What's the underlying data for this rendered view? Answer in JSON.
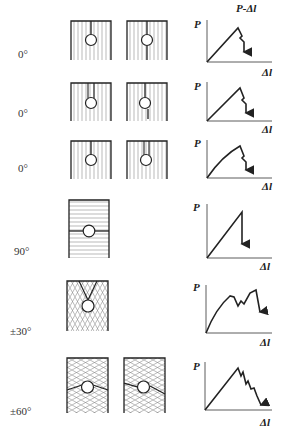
{
  "figure": {
    "title": "P-Δl",
    "y_axis_label": "P",
    "x_axis_label": "Δl"
  },
  "rows": [
    {
      "angle": "0°",
      "specimens": 2,
      "fiber": "vertical",
      "crack": "from top to hole (left); through hole (right)",
      "curve": "linear rise, sawtooth drop"
    },
    {
      "angle": "0°",
      "specimens": 2,
      "fiber": "vertical",
      "crack": "double-line slot to hole (left); slot to hole with crack below (right)",
      "curve": "linear rise, sawtooth drop"
    },
    {
      "angle": "0°",
      "specimens": 2,
      "fiber": "vertical",
      "crack": "slot to hole",
      "curve": "nonlinear rise, sawtooth drop"
    },
    {
      "angle": "90°",
      "specimens": 1,
      "fiber": "horizontal",
      "crack": "horizontal through hole",
      "curve": "linear rise, sudden drop"
    },
    {
      "angle": "±30°",
      "specimens": 1,
      "fiber": "±30° cross-hatch",
      "crack": "V-shape from top to hole",
      "curve": "nonlinear rise, multiple peaks, drop"
    },
    {
      "angle": "±60°",
      "specimens": 2,
      "fiber": "±60° cross-hatch",
      "crack": "inclined through hole",
      "curve": "linear rise, progressive sawtooth drop"
    }
  ],
  "colors": {
    "ink": "#222222",
    "hatch": "#8a8a8a",
    "background": "#ffffff"
  }
}
